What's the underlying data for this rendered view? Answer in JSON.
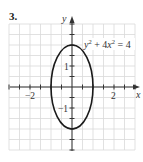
{
  "problem_number": "3.",
  "chart_data": {
    "type": "line",
    "title": "",
    "equation": "y^2 + 4x^2 = 4",
    "curve": {
      "kind": "ellipse",
      "center": [
        0,
        0
      ],
      "semi_axis_x": 1,
      "semi_axis_y": 2,
      "points": [
        [
          0,
          2
        ],
        [
          0.5,
          1.732
        ],
        [
          0.866,
          1
        ],
        [
          1,
          0
        ],
        [
          0.866,
          -1
        ],
        [
          0.5,
          -1.732
        ],
        [
          0,
          -2
        ],
        [
          -0.5,
          -1.732
        ],
        [
          -0.866,
          -1
        ],
        [
          -1,
          0
        ],
        [
          -0.866,
          1
        ],
        [
          -0.5,
          1.732
        ]
      ]
    },
    "xlabel": "x",
    "ylabel": "y",
    "xlim": [
      -3,
      3
    ],
    "ylim": [
      -3,
      3
    ],
    "grid": true,
    "grid_step": 0.5,
    "x_tick_labels": [
      {
        "value": -2,
        "label": "−2"
      },
      {
        "value": 2,
        "label": "2"
      }
    ],
    "y_tick_labels": [
      {
        "value": 1,
        "label": "1"
      },
      {
        "value": -1,
        "label": "−1"
      }
    ],
    "legend": null
  },
  "labels": {
    "x_axis": "x",
    "y_axis": "y",
    "x_neg2": "−2",
    "x_pos2": "2",
    "y_pos1": "1",
    "y_neg1": "−1",
    "equation_y": "y",
    "equation_sup1": "2",
    "equation_mid": " + 4",
    "equation_x": "x",
    "equation_sup2": "2",
    "equation_end": " = 4"
  },
  "colors": {
    "grid": "#d9d9d9",
    "axis": "#333333",
    "curve": "#1a1a1a",
    "background": "#ffffff"
  }
}
